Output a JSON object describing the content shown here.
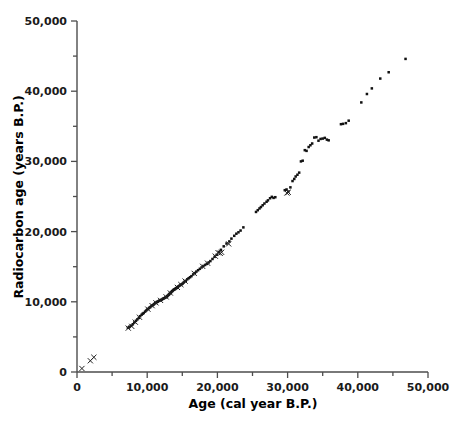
{
  "chart_data": {
    "type": "scatter",
    "title": "",
    "subtitle": "",
    "xlabel": "Age (cal year B.P.)",
    "ylabel": "Radiocarbon age (years B.P.)",
    "xlim": [
      0,
      50000
    ],
    "ylim": [
      0,
      50000
    ],
    "xticks": [
      0,
      10000,
      20000,
      30000,
      40000,
      50000
    ],
    "yticks": [
      0,
      10000,
      20000,
      30000,
      40000,
      50000
    ],
    "xtick_labels": [
      "0",
      "10,000",
      "20,000",
      "30,000",
      "40,000",
      "50,000"
    ],
    "ytick_labels": [
      "0",
      "10,000",
      "20,000",
      "30,000",
      "40,000",
      "50,000"
    ],
    "minor_tick_interval": 5000,
    "grid": false,
    "legend": null,
    "legend_position": "none",
    "annotations": [],
    "series": [
      {
        "name": "dot-markers",
        "marker": "filled-square-dot",
        "color": "#111111",
        "points": [
          [
            7250,
            6300
          ],
          [
            7450,
            6450
          ],
          [
            7700,
            6600
          ],
          [
            7950,
            6800
          ],
          [
            8150,
            7050
          ],
          [
            8400,
            7300
          ],
          [
            8600,
            7500
          ],
          [
            8800,
            7700
          ],
          [
            9000,
            7950
          ],
          [
            9200,
            8150
          ],
          [
            9350,
            8300
          ],
          [
            9500,
            8400
          ],
          [
            9700,
            8600
          ],
          [
            9850,
            8750
          ],
          [
            10000,
            8900
          ],
          [
            10150,
            9000
          ],
          [
            10300,
            9150
          ],
          [
            10450,
            9250
          ],
          [
            10600,
            9400
          ],
          [
            10750,
            9500
          ],
          [
            10900,
            9600
          ],
          [
            11000,
            9700
          ],
          [
            11150,
            9800
          ],
          [
            11300,
            9900
          ],
          [
            11400,
            10000
          ],
          [
            11550,
            10050
          ],
          [
            11700,
            10150
          ],
          [
            11800,
            10200
          ],
          [
            11950,
            10250
          ],
          [
            12050,
            10300
          ],
          [
            12200,
            10400
          ],
          [
            12300,
            10450
          ],
          [
            12400,
            10500
          ],
          [
            12550,
            10600
          ],
          [
            12650,
            10650
          ],
          [
            12750,
            10700
          ],
          [
            12850,
            10800
          ],
          [
            12950,
            10900
          ],
          [
            13050,
            11000
          ],
          [
            13150,
            11100
          ],
          [
            13250,
            11200
          ],
          [
            13350,
            11300
          ],
          [
            13450,
            11400
          ],
          [
            13550,
            11500
          ],
          [
            13650,
            11600
          ],
          [
            13750,
            11700
          ],
          [
            13850,
            11750
          ],
          [
            13950,
            11800
          ],
          [
            14050,
            11900
          ],
          [
            14150,
            11950
          ],
          [
            14250,
            12000
          ],
          [
            14350,
            12100
          ],
          [
            14450,
            12200
          ],
          [
            14600,
            12300
          ],
          [
            14750,
            12400
          ],
          [
            14900,
            12500
          ],
          [
            15050,
            12600
          ],
          [
            15200,
            12750
          ],
          [
            15350,
            12900
          ],
          [
            15500,
            13000
          ],
          [
            15700,
            13200
          ],
          [
            15900,
            13350
          ],
          [
            16100,
            13500
          ],
          [
            16300,
            13650
          ],
          [
            16550,
            13900
          ],
          [
            16800,
            14100
          ],
          [
            17000,
            14300
          ],
          [
            17250,
            14500
          ],
          [
            17500,
            14700
          ],
          [
            17750,
            14900
          ],
          [
            18000,
            15100
          ],
          [
            18250,
            15250
          ],
          [
            18500,
            15400
          ],
          [
            18750,
            15600
          ],
          [
            19000,
            15800
          ],
          [
            19300,
            16100
          ],
          [
            19600,
            16400
          ],
          [
            19900,
            16700
          ],
          [
            20200,
            17100
          ],
          [
            20500,
            17400
          ],
          [
            20900,
            17900
          ],
          [
            21300,
            18300
          ],
          [
            21700,
            18600
          ],
          [
            22000,
            19000
          ],
          [
            22400,
            19400
          ],
          [
            22700,
            19700
          ],
          [
            23000,
            19900
          ],
          [
            23300,
            20150
          ],
          [
            23700,
            20600
          ],
          [
            25500,
            22800
          ],
          [
            25750,
            23050
          ],
          [
            26000,
            23300
          ],
          [
            26200,
            23500
          ],
          [
            26450,
            23750
          ],
          [
            26700,
            24000
          ],
          [
            27000,
            24250
          ],
          [
            27200,
            24450
          ],
          [
            27500,
            24750
          ],
          [
            27750,
            24950
          ],
          [
            28000,
            24800
          ],
          [
            28250,
            24900
          ],
          [
            29600,
            25900
          ],
          [
            29850,
            26000
          ],
          [
            30100,
            25700
          ],
          [
            30400,
            26300
          ],
          [
            30700,
            27200
          ],
          [
            30950,
            27500
          ],
          [
            31150,
            27850
          ],
          [
            31400,
            28100
          ],
          [
            31650,
            28400
          ],
          [
            31900,
            30000
          ],
          [
            32150,
            30100
          ],
          [
            32450,
            31600
          ],
          [
            32700,
            31500
          ],
          [
            33000,
            32050
          ],
          [
            33250,
            32300
          ],
          [
            33500,
            32550
          ],
          [
            33800,
            33400
          ],
          [
            34100,
            33450
          ],
          [
            34400,
            32950
          ],
          [
            34700,
            33200
          ],
          [
            35000,
            33250
          ],
          [
            35300,
            33350
          ],
          [
            35600,
            33100
          ],
          [
            35850,
            33000
          ],
          [
            37600,
            35300
          ],
          [
            37900,
            35350
          ],
          [
            38300,
            35450
          ],
          [
            38700,
            35800
          ],
          [
            40500,
            38400
          ],
          [
            41300,
            39600
          ],
          [
            42000,
            40400
          ],
          [
            43200,
            41800
          ],
          [
            44400,
            42700
          ],
          [
            46800,
            44600
          ]
        ]
      },
      {
        "name": "cross-markers",
        "marker": "x-cross",
        "color": "#222222",
        "points": [
          [
            700,
            500
          ],
          [
            1900,
            1600
          ],
          [
            2400,
            2100
          ],
          [
            7300,
            6250
          ],
          [
            7800,
            6500
          ],
          [
            8300,
            7100
          ],
          [
            8900,
            7800
          ],
          [
            10100,
            8950
          ],
          [
            10700,
            9450
          ],
          [
            11250,
            9850
          ],
          [
            11900,
            10200
          ],
          [
            12700,
            10700
          ],
          [
            13300,
            11250
          ],
          [
            14300,
            12050
          ],
          [
            14800,
            12450
          ],
          [
            15400,
            12950
          ],
          [
            16700,
            14050
          ],
          [
            17900,
            15050
          ],
          [
            18600,
            15500
          ],
          [
            19700,
            16500
          ],
          [
            20100,
            17000
          ],
          [
            20400,
            16900
          ],
          [
            20600,
            17050
          ],
          [
            21600,
            18250
          ],
          [
            29900,
            25500
          ],
          [
            30100,
            25600
          ]
        ]
      }
    ]
  },
  "axes": {
    "geometry": {
      "left_px": 77,
      "right_px": 428,
      "top_px": 21,
      "bottom_px": 372
    }
  }
}
